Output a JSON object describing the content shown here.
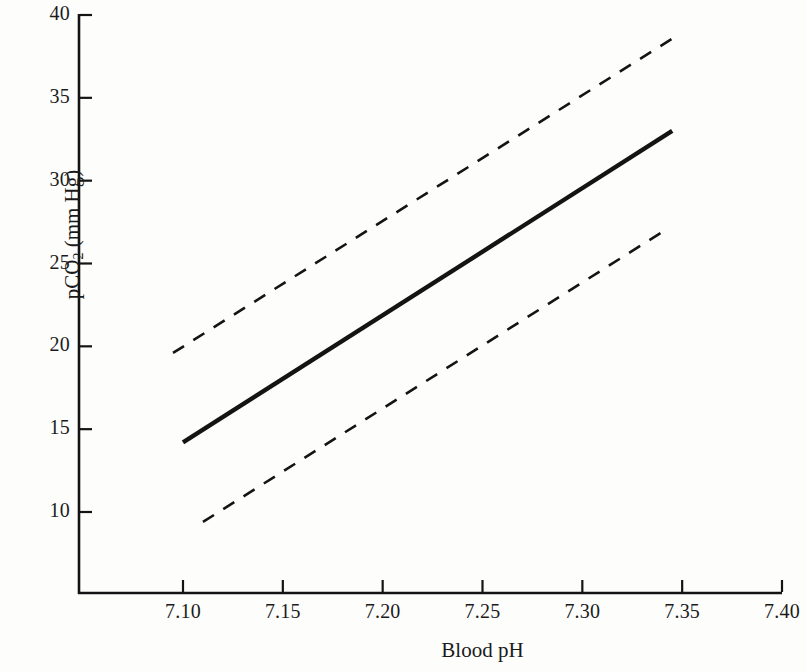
{
  "chart_data": {
    "type": "line",
    "title": "",
    "xlabel": "Blood pH",
    "ylabel_main": "pCO",
    "ylabel_sub": "2",
    "ylabel_unit": " (mm Hg)",
    "ylabel_full": "pCO2 (mm Hg)",
    "xlim": [
      7.05,
      7.4
    ],
    "ylim": [
      5.1,
      40
    ],
    "xticks": [
      "7.10",
      "7.15",
      "7.20",
      "7.25",
      "7.30",
      "7.35",
      "7.40"
    ],
    "xtick_values": [
      7.1,
      7.15,
      7.2,
      7.25,
      7.3,
      7.35,
      7.4
    ],
    "yticks": [
      "10",
      "15",
      "20",
      "25",
      "30",
      "35",
      "40"
    ],
    "ytick_values": [
      10,
      15,
      20,
      25,
      30,
      35,
      40
    ],
    "grid": false,
    "legend": "none",
    "series": [
      {
        "name": "regression-line",
        "style": "solid",
        "color": "#141414",
        "x": [
          7.1,
          7.345
        ],
        "values": [
          14.2,
          33.0
        ]
      },
      {
        "name": "upper-confidence-limit",
        "style": "dashed",
        "color": "#141414",
        "x": [
          7.095,
          7.348
        ],
        "values": [
          19.6,
          38.8
        ]
      },
      {
        "name": "lower-confidence-limit",
        "style": "dashed",
        "color": "#141414",
        "x": [
          7.11,
          7.34
        ],
        "values": [
          9.4,
          26.9
        ]
      }
    ]
  }
}
